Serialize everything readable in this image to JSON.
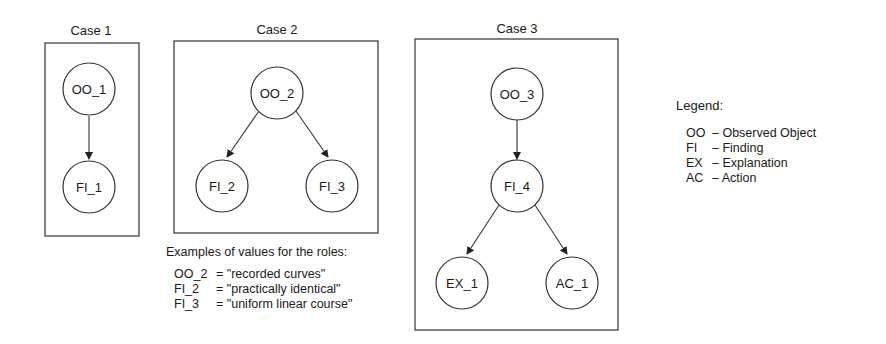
{
  "diagram": {
    "cases": [
      {
        "title": "Case 1",
        "nodes": [
          {
            "id": "OO_1",
            "label": "OO_1"
          },
          {
            "id": "FI_1",
            "label": "FI_1"
          }
        ],
        "edges": [
          [
            "OO_1",
            "FI_1"
          ]
        ]
      },
      {
        "title": "Case 2",
        "nodes": [
          {
            "id": "OO_2",
            "label": "OO_2"
          },
          {
            "id": "FI_2",
            "label": "FI_2"
          },
          {
            "id": "FI_3",
            "label": "FI_3"
          }
        ],
        "edges": [
          [
            "OO_2",
            "FI_2"
          ],
          [
            "OO_2",
            "FI_3"
          ]
        ]
      },
      {
        "title": "Case 3",
        "nodes": [
          {
            "id": "OO_3",
            "label": "OO_3"
          },
          {
            "id": "FI_4",
            "label": "FI_4"
          },
          {
            "id": "EX_1",
            "label": "EX_1"
          },
          {
            "id": "AC_1",
            "label": "AC_1"
          }
        ],
        "edges": [
          [
            "OO_3",
            "FI_4"
          ],
          [
            "FI_4",
            "EX_1"
          ],
          [
            "FI_4",
            "AC_1"
          ]
        ]
      }
    ],
    "examples": {
      "title": "Examples of values for the roles:",
      "rows": [
        {
          "key": "OO_2",
          "value": "= \"recorded curves\""
        },
        {
          "key": "FI_2",
          "value": "= \"practically identical\""
        },
        {
          "key": "FI_3",
          "value": "= \"uniform linear course\""
        }
      ]
    },
    "legend": {
      "title": "Legend:",
      "items": [
        {
          "abbr": "OO",
          "meaning": "– Observed Object"
        },
        {
          "abbr": "FI",
          "meaning": "– Finding"
        },
        {
          "abbr": "EX",
          "meaning": "– Explanation"
        },
        {
          "abbr": "AC",
          "meaning": "– Action"
        }
      ]
    }
  }
}
